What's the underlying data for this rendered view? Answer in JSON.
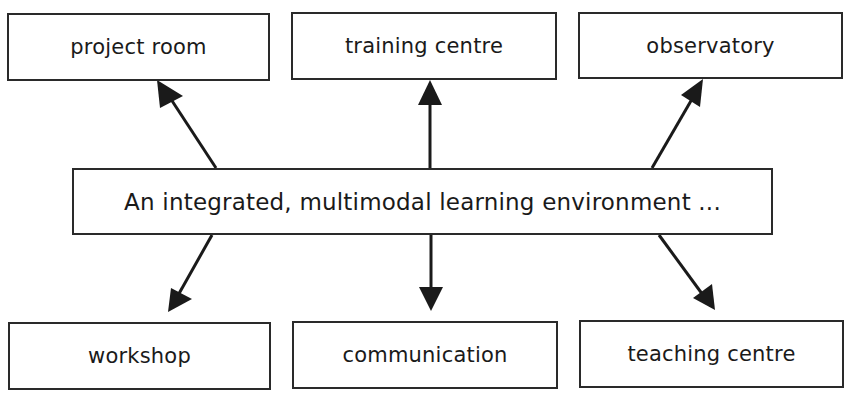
{
  "diagram": {
    "center": {
      "label": "An integrated, multimodal learning environment ..."
    },
    "top_nodes": [
      {
        "label": "project room"
      },
      {
        "label": "training centre"
      },
      {
        "label": "observatory"
      }
    ],
    "bottom_nodes": [
      {
        "label": "workshop"
      },
      {
        "label": "communication"
      },
      {
        "label": "teaching centre"
      }
    ],
    "edges": [
      {
        "from": "center",
        "to": "project room"
      },
      {
        "from": "center",
        "to": "training centre"
      },
      {
        "from": "center",
        "to": "observatory"
      },
      {
        "from": "center",
        "to": "workshop"
      },
      {
        "from": "center",
        "to": "communication"
      },
      {
        "from": "center",
        "to": "teaching centre"
      }
    ],
    "colors": {
      "line": "#2a2a2a",
      "background": "#ffffff"
    }
  }
}
